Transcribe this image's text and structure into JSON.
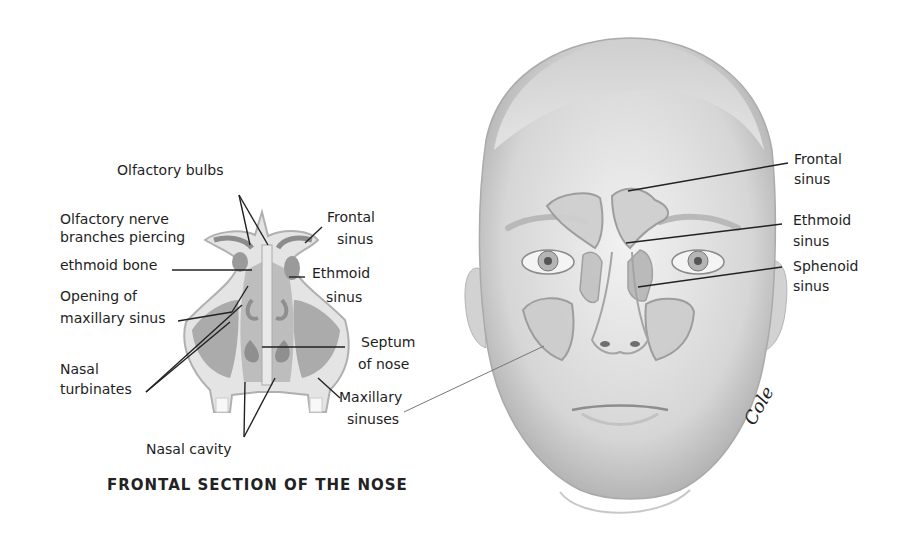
{
  "left_figure": {
    "caption": "FRONTAL SECTION OF THE NOSE",
    "labels": {
      "olfactory_bulbs": "Olfactory bulbs",
      "olfactory_nerve_1": "Olfactory nerve",
      "olfactory_nerve_2": "branches piercing",
      "olfactory_nerve_3": "ethmoid bone",
      "opening_1": "Opening of",
      "opening_2": "maxillary sinus",
      "nasal_turbinates_1": "Nasal",
      "nasal_turbinates_2": "turbinates",
      "nasal_cavity": "Nasal cavity",
      "frontal_sinus_1": "Frontal",
      "frontal_sinus_2": "sinus",
      "ethmoid_sinus_1": "Ethmoid",
      "ethmoid_sinus_2": "sinus",
      "septum_1": "Septum",
      "septum_2": "of nose",
      "maxillary_1": "Maxillary",
      "maxillary_2": "sinuses"
    }
  },
  "right_figure": {
    "labels": {
      "frontal_1": "Frontal",
      "frontal_2": "sinus",
      "ethmoid_1": "Ethmoid",
      "ethmoid_2": "sinus",
      "sphenoid_1": "Sphenoid",
      "sphenoid_2": "sinus"
    },
    "signature": "Cole"
  },
  "colors": {
    "skin": "#e2e2e2",
    "skin_shadow": "#b8b8b8",
    "sinus_fill": "#cfcfcf",
    "sinus_edge": "#9a9a9a",
    "line": "#222222"
  }
}
